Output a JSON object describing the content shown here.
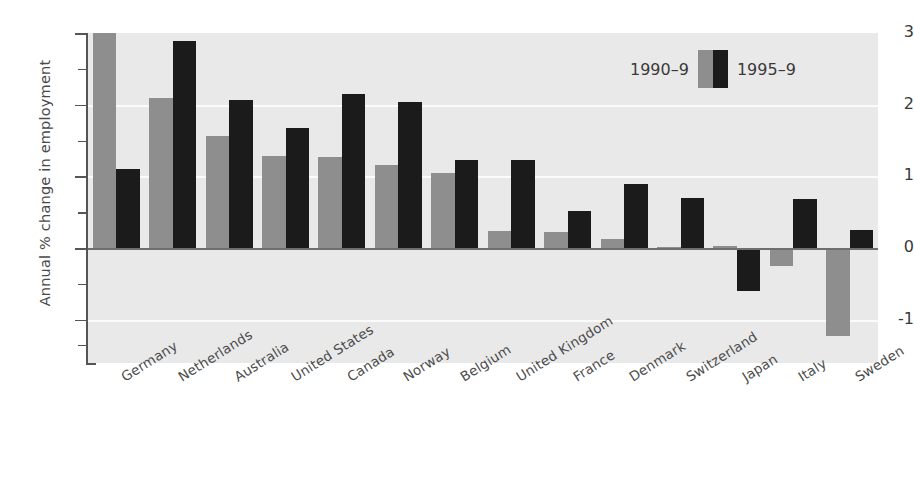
{
  "chart_data": {
    "type": "bar",
    "title": "",
    "xlabel": "",
    "ylabel": "Annual % change in employment",
    "ylim": [
      -1.45,
      3.0
    ],
    "yticks": [
      3,
      2,
      1,
      0,
      -1
    ],
    "ytick_labels": [
      "3",
      "2",
      "1",
      "0",
      "-1"
    ],
    "minor_ticks": [
      2.5,
      1.5,
      0.5,
      -0.5,
      -1.35
    ],
    "grid": "horizontal white gridlines at 2, 1, -1",
    "legend_position": "top-right",
    "categories": [
      "Germany",
      "Netherlands",
      "Australia",
      "United States",
      "Canada",
      "Norway",
      "Belgium",
      "United Kingdom",
      "France",
      "Denmark",
      "Switzerland",
      "Japan",
      "Italy",
      "Sweden"
    ],
    "series": [
      {
        "name": "1990-9",
        "color": "#8e8e8e",
        "values": [
          3.0,
          2.1,
          1.57,
          1.28,
          1.27,
          1.16,
          1.05,
          0.24,
          0.22,
          0.13,
          0.01,
          0.03,
          -0.25,
          -1.22
        ]
      },
      {
        "name": "1995-9",
        "color": "#1b1b1b",
        "values": [
          1.1,
          2.89,
          2.07,
          1.67,
          2.15,
          2.04,
          1.23,
          1.23,
          0.52,
          0.9,
          0.7,
          -0.6,
          0.68,
          0.26
        ]
      }
    ]
  },
  "legend": {
    "left_label": "1990–9",
    "right_label": "1995–9"
  },
  "axis": {
    "y_title": "Annual % change in employment"
  }
}
